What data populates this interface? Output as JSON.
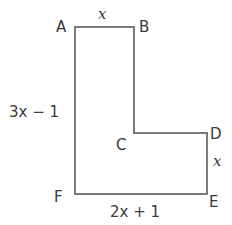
{
  "diagram": {
    "shape": "L-shaped polygon",
    "stroke_color": "#7a7a7a",
    "text_color": "#3a3a3a",
    "vertices": [
      {
        "label": "A",
        "x": 75,
        "y": 27
      },
      {
        "label": "B",
        "x": 134,
        "y": 27
      },
      {
        "label": "C",
        "x": 134,
        "y": 133
      },
      {
        "label": "D",
        "x": 207,
        "y": 133
      },
      {
        "label": "E",
        "x": 207,
        "y": 194
      },
      {
        "label": "F",
        "x": 75,
        "y": 194
      }
    ],
    "points": "75,27 134,27 134,133 207,133 207,194 75,194",
    "side_labels": {
      "AB": "x",
      "AF": "3x − 1",
      "DE": "x",
      "FE": "2x + 1"
    }
  }
}
